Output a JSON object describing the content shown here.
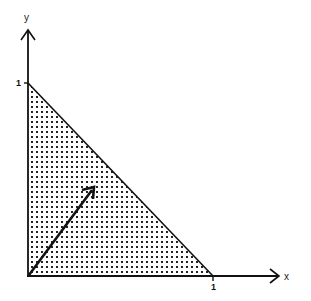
{
  "diagram": {
    "type": "unit simplex with vector",
    "axes": {
      "x": {
        "label": "x",
        "tick": "1"
      },
      "y": {
        "label": "y",
        "tick": "1"
      }
    },
    "region": {
      "shape": "triangle",
      "vertices": [
        [
          0,
          0
        ],
        [
          1,
          0
        ],
        [
          0,
          1
        ]
      ],
      "fill": "dotted stipple",
      "color": "#000000"
    },
    "vector": {
      "from": [
        0,
        0
      ],
      "to": [
        0.36,
        0.45
      ],
      "label": ""
    }
  },
  "colors": {
    "ink": "#111111",
    "background": "#ffffff"
  }
}
